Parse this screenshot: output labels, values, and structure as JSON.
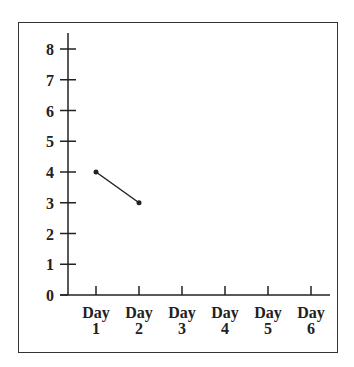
{
  "chart_data": {
    "type": "line",
    "title": "",
    "xlabel": "",
    "ylabel": "",
    "categories": [
      "Day 1",
      "Day 2",
      "Day 3",
      "Day 4",
      "Day 5",
      "Day 6"
    ],
    "x_tick_labels": [
      {
        "line1": "Day",
        "line2": "1"
      },
      {
        "line1": "Day",
        "line2": "2"
      },
      {
        "line1": "Day",
        "line2": "3"
      },
      {
        "line1": "Day",
        "line2": "4"
      },
      {
        "line1": "Day",
        "line2": "5"
      },
      {
        "line1": "Day",
        "line2": "6"
      }
    ],
    "y_ticks": [
      "0",
      "1",
      "2",
      "3",
      "4",
      "5",
      "6",
      "7",
      "8"
    ],
    "ylim": [
      0,
      8
    ],
    "grid": false,
    "legend": null,
    "series": [
      {
        "name": "values",
        "values": [
          4,
          3,
          null,
          null,
          null,
          null
        ],
        "color": "#222222"
      }
    ]
  }
}
